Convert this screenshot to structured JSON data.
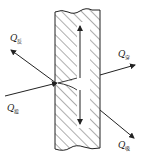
{
  "diagram": {
    "title": "",
    "labels": {
      "reflected": {
        "symbol": "Q",
        "sub": "反"
      },
      "incident": {
        "symbol": "Q",
        "sub": "投"
      },
      "transmitted": {
        "symbol": "Q",
        "sub": "穿"
      },
      "absorbed": {
        "symbol": "Q",
        "sub": "吸"
      }
    },
    "colors": {
      "line": "#222222",
      "background": "#ffffff"
    }
  }
}
